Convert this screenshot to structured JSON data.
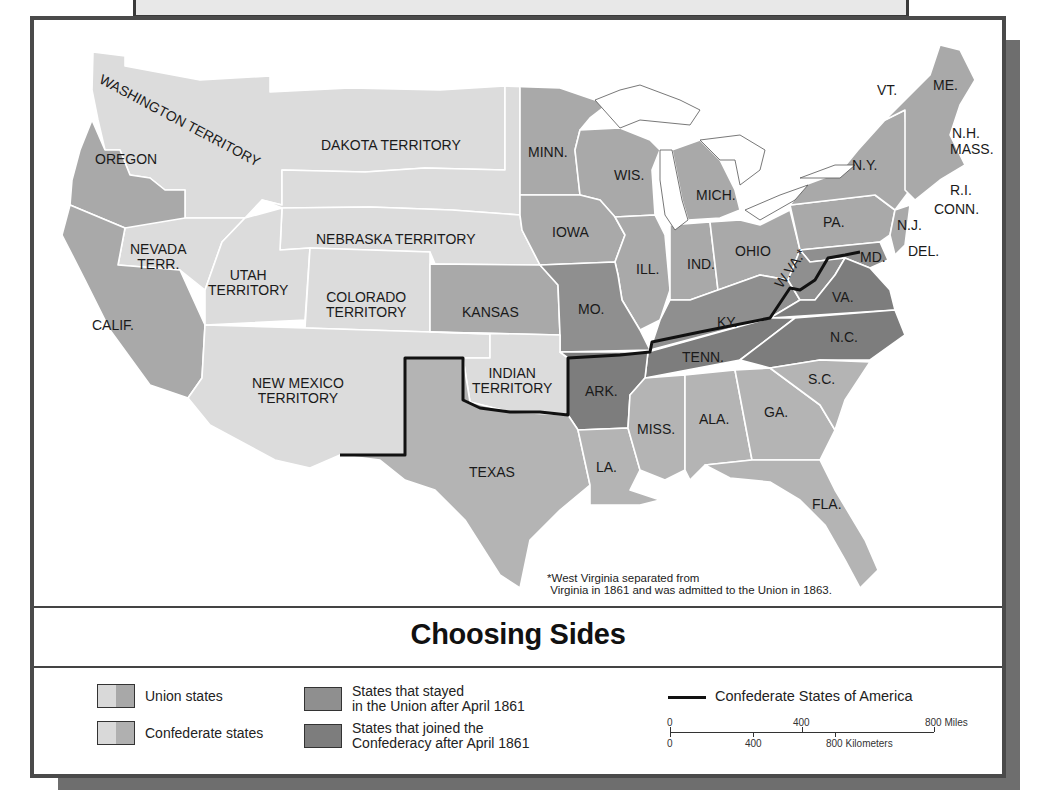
{
  "map": {
    "title": "Choosing Sides",
    "footnote": {
      "marker": "*",
      "line1": "West Virginia separated from",
      "line2": "Virginia in 1861 and was admitted to the Union in 1863."
    },
    "regions": {
      "washington": "WASHINGTON TERRITORY",
      "oregon": "OREGON",
      "dakota": "DAKOTA TERRITORY",
      "minn": "MINN.",
      "wis": "WIS.",
      "mich": "MICH.",
      "nebraska": "NEBRASKA TERRITORY",
      "iowa": "IOWA",
      "ill": "ILL.",
      "ind": "IND.",
      "ohio": "OHIO",
      "pa": "PA.",
      "ny": "N.Y.",
      "vt": "VT.",
      "me": "ME.",
      "nh": "N.H.",
      "mass": "MASS.",
      "ri": "R.I.",
      "conn": "CONN.",
      "nj": "N.J.",
      "del": "DEL.",
      "md": "MD.",
      "nevada_1": "NEVADA",
      "nevada_2": "TERR.",
      "utah_1": "UTAH",
      "utah_2": "TERRITORY",
      "colorado_1": "COLORADO",
      "colorado_2": "TERRITORY",
      "kansas": "KANSAS",
      "mo": "MO.",
      "ky": "KY.",
      "wva": "W.VA.*",
      "va": "VA.",
      "calif": "CALIF.",
      "tenn": "TENN.",
      "nc": "N.C.",
      "newmexico_1": "NEW MEXICO",
      "newmexico_2": "TERRITORY",
      "indian_1": "INDIAN",
      "indian_2": "TERRITORY",
      "ark": "ARK.",
      "sc": "S.C.",
      "miss": "MISS.",
      "ala": "ALA.",
      "ga": "GA.",
      "la": "LA.",
      "texas": "TEXAS",
      "fla": "FLA."
    },
    "colors": {
      "territory": "#dcdcdc",
      "union": "#a9a9a9",
      "confederate": "#b4b4b4",
      "border_stayed_union": "#8f8f8f",
      "joined_confederacy": "#7d7d7d",
      "csa_boundary": "#111111",
      "water": "#ffffff"
    }
  },
  "legend": {
    "union_states": "Union states",
    "confederate_states": "Confederate states",
    "stayed_union_1": "States that stayed",
    "stayed_union_2": "in the Union after April 1861",
    "joined_conf_1": "States that joined the",
    "joined_conf_2": "Confederacy after April 1861",
    "csa": "Confederate States of America"
  },
  "scale": {
    "miles_0": "0",
    "miles_400": "400",
    "miles_800": "800 Miles",
    "km_0": "0",
    "km_400": "400",
    "km_800": "800 Kilometers"
  }
}
